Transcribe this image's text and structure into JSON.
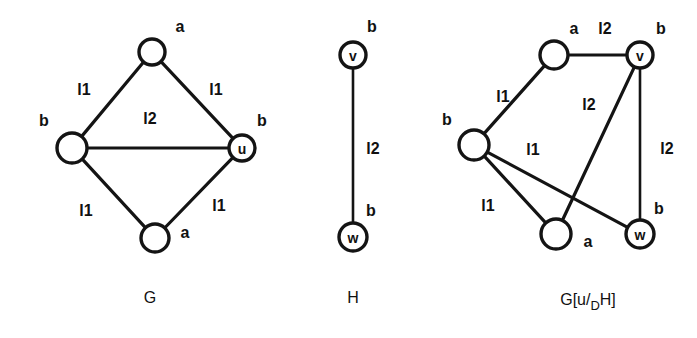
{
  "figure": {
    "background_color": "#ffffff",
    "ink_color": "#141414",
    "panels": [
      {
        "id": "panel-g",
        "caption": "G",
        "caption_pos": [
          150,
          297
        ],
        "nodes": [
          {
            "id": "g-top",
            "label": "",
            "attr": "a",
            "cx": 152,
            "cy": 52,
            "r": 13,
            "attr_pos": [
              180,
              26
            ]
          },
          {
            "id": "g-left",
            "label": "",
            "attr": "b",
            "cx": 72,
            "cy": 148,
            "r": 15,
            "attr_pos": [
              44,
              120
            ]
          },
          {
            "id": "g-right",
            "label": "u",
            "attr": "b",
            "cx": 242,
            "cy": 148,
            "r": 13,
            "attr_pos": [
              262,
              120
            ]
          },
          {
            "id": "g-bottom",
            "label": "",
            "attr": "a",
            "cx": 155,
            "cy": 238,
            "r": 14,
            "attr_pos": [
              185,
              232
            ]
          }
        ],
        "edges": [
          {
            "from": "g-left",
            "to": "g-top",
            "label": "l1",
            "label_pos": [
              84,
              89
            ]
          },
          {
            "from": "g-top",
            "to": "g-right",
            "label": "l1",
            "label_pos": [
              216,
              89
            ]
          },
          {
            "from": "g-left",
            "to": "g-right",
            "label": "l2",
            "label_pos": [
              150,
              118
            ]
          },
          {
            "from": "g-left",
            "to": "g-bottom",
            "label": "l1",
            "label_pos": [
              86,
              210
            ]
          },
          {
            "from": "g-bottom",
            "to": "g-right",
            "label": "l1",
            "label_pos": [
              219,
              205
            ]
          }
        ]
      },
      {
        "id": "panel-h",
        "caption": "H",
        "caption_pos": [
          353,
          297
        ],
        "nodes": [
          {
            "id": "h-v",
            "label": "v",
            "attr": "b",
            "cx": 353,
            "cy": 55,
            "r": 13,
            "attr_pos": [
              372,
              26
            ]
          },
          {
            "id": "h-w",
            "label": "w",
            "attr": "b",
            "cx": 353,
            "cy": 237,
            "r": 14,
            "attr_pos": [
              371,
              210
            ]
          }
        ],
        "edges": [
          {
            "from": "h-v",
            "to": "h-w",
            "label": "l2",
            "label_pos": [
              373,
              148
            ]
          }
        ]
      },
      {
        "id": "panel-gsub",
        "caption": "G[u/",
        "caption_sub": "D",
        "caption_sup": "H]",
        "caption_pos": [
          588,
          299
        ],
        "nodes": [
          {
            "id": "s-topleft",
            "label": "",
            "attr": "a",
            "cx": 554,
            "cy": 55,
            "r": 14,
            "attr_pos": [
              574,
              28
            ]
          },
          {
            "id": "s-v",
            "label": "v",
            "attr": "b",
            "cx": 640,
            "cy": 55,
            "r": 13,
            "attr_pos": [
              661,
              28
            ]
          },
          {
            "id": "s-left",
            "label": "",
            "attr": "b",
            "cx": 474,
            "cy": 145,
            "r": 15,
            "attr_pos": [
              447,
              119
            ]
          },
          {
            "id": "s-botleft",
            "label": "",
            "attr": "a",
            "cx": 556,
            "cy": 234,
            "r": 15,
            "attr_pos": [
              588,
              241
            ]
          },
          {
            "id": "s-w",
            "label": "w",
            "attr": "b",
            "cx": 640,
            "cy": 234,
            "r": 14,
            "attr_pos": [
              659,
              208
            ]
          }
        ],
        "edges": [
          {
            "from": "s-left",
            "to": "s-topleft",
            "label": "l1",
            "label_pos": [
              503,
              96
            ]
          },
          {
            "from": "s-topleft",
            "to": "s-v",
            "label": "l2",
            "label_pos": [
              605,
              28
            ]
          },
          {
            "from": "s-v",
            "to": "s-botleft",
            "label": "l2",
            "label_pos": [
              589,
              104
            ]
          },
          {
            "from": "s-v",
            "to": "s-w",
            "label": "l2",
            "label_pos": [
              667,
              148
            ]
          },
          {
            "from": "s-left",
            "to": "s-w",
            "label": "l1",
            "label_pos": [
              533,
              149
            ]
          },
          {
            "from": "s-left",
            "to": "s-botleft",
            "label": "l1",
            "label_pos": [
              488,
              205
            ]
          }
        ]
      }
    ]
  }
}
